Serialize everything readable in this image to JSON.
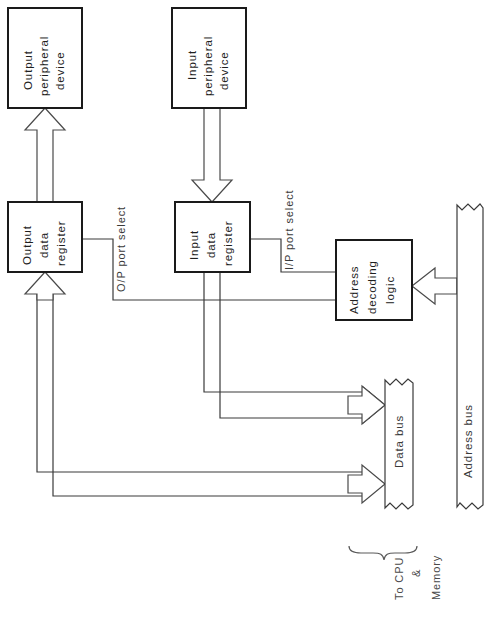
{
  "diagram": {
    "colors": {
      "background": "#ffffff",
      "box_stroke": "#1a1a1a",
      "wire_stroke": "#3a3a3a",
      "text": "#2a2a2a"
    }
  },
  "blocks": {
    "output_peripheral": {
      "line1": "Output",
      "line2": "peripheral",
      "line3": "device"
    },
    "input_peripheral": {
      "line1": "Input",
      "line2": "peripheral",
      "line3": "device"
    },
    "output_register": {
      "line1": "Output",
      "line2": "data",
      "line3": "register"
    },
    "input_register": {
      "line1": "Input",
      "line2": "data",
      "line3": "register"
    },
    "address_decoder": {
      "line1": "Address",
      "line2": "decoding",
      "line3": "logic"
    }
  },
  "buses": {
    "data_bus": "Data  bus",
    "address_bus": "Address  bus"
  },
  "labels": {
    "op_port_select": "O/P port select",
    "ip_port_select": "I/P port select",
    "to_cpu_line1": "To CPU",
    "to_cpu_line2": "&",
    "to_cpu_line3": "Memory"
  }
}
